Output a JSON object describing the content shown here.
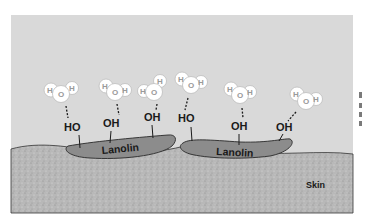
{
  "diagram": {
    "colors": {
      "background": "#ffffff",
      "air": "#d9d9d9",
      "skin": "#b5b5b5",
      "lanolin": "#8c8c8c",
      "molecule": "#ffffff"
    },
    "labels": {
      "skin": "Skin",
      "lanolin_1": "Lanolin",
      "lanolin_2": "Lanolin"
    },
    "hydroxyl_groups": [
      {
        "label": "HO",
        "x": 72,
        "y": 131
      },
      {
        "label": "OH",
        "x": 111,
        "y": 127
      },
      {
        "label": "OH",
        "x": 152,
        "y": 121
      },
      {
        "label": "HO",
        "x": 186,
        "y": 122
      },
      {
        "label": "OH",
        "x": 239,
        "y": 130
      },
      {
        "label": "OH",
        "x": 284,
        "y": 131
      }
    ],
    "water_molecules": [
      {
        "atoms": [
          "H",
          "O",
          "H"
        ],
        "x": 61,
        "y": 93
      },
      {
        "atoms": [
          "H",
          "O",
          "H"
        ],
        "x": 115,
        "y": 91
      },
      {
        "atoms": [
          "H",
          "O",
          "H"
        ],
        "x": 154,
        "y": 92
      },
      {
        "atoms": [
          "H",
          "O",
          "H"
        ],
        "x": 191,
        "y": 84
      },
      {
        "atoms": [
          "H",
          "O",
          "H"
        ],
        "x": 240,
        "y": 94
      },
      {
        "atoms": [
          "H",
          "O",
          "H"
        ],
        "x": 306,
        "y": 100
      }
    ],
    "caption_fragments": [
      "(",
      "I",
      "I",
      "I"
    ]
  }
}
